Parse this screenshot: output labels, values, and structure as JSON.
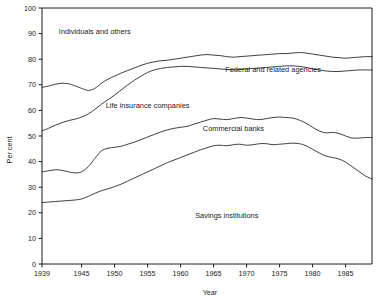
{
  "chart_data": {
    "type": "area",
    "title": "",
    "subtitle": "",
    "xlabel": "Year",
    "ylabel": "Per cent",
    "xlim": [
      1939,
      1989
    ],
    "ylim": [
      0,
      100
    ],
    "grid": false,
    "legend_position": "inline-annotations",
    "x_ticks": [
      1939,
      1945,
      1950,
      1955,
      1960,
      1965,
      1970,
      1975,
      1980,
      1985
    ],
    "y_ticks": [
      0,
      10,
      20,
      30,
      40,
      50,
      60,
      70,
      80,
      90,
      100
    ],
    "x": [
      1939,
      1940,
      1941,
      1942,
      1943,
      1944,
      1945,
      1946,
      1947,
      1948,
      1949,
      1950,
      1951,
      1952,
      1953,
      1954,
      1955,
      1956,
      1957,
      1958,
      1959,
      1960,
      1961,
      1962,
      1963,
      1964,
      1965,
      1966,
      1967,
      1968,
      1969,
      1970,
      1971,
      1972,
      1973,
      1974,
      1975,
      1976,
      1977,
      1978,
      1979,
      1980,
      1981,
      1982,
      1983,
      1984,
      1985,
      1986,
      1987,
      1988,
      1989
    ],
    "annotations": [
      {
        "text": "Individuals and others",
        "x": 1947,
        "y": 90
      },
      {
        "text": "Federal and related agencies",
        "x": 1974,
        "y": 75
      },
      {
        "text": "Life insurance companies",
        "x": 1955,
        "y": 61
      },
      {
        "text": "Commercial banks",
        "x": 1968,
        "y": 52
      },
      {
        "text": "Savings institutions",
        "x": 1967,
        "y": 18
      }
    ],
    "series": [
      {
        "name": "Individuals and others",
        "label": "Individuals and others",
        "description": "Upper cumulative boundary line",
        "values": [
          69,
          69.5,
          70.2,
          70.6,
          70.4,
          69.6,
          68.6,
          67.8,
          68.6,
          70.6,
          72.2,
          73.4,
          74.6,
          75.6,
          76.6,
          77.6,
          78.4,
          79.0,
          79.4,
          79.6,
          80.0,
          80.4,
          80.8,
          81.2,
          81.6,
          81.8,
          81.6,
          81.4,
          81.0,
          80.8,
          81.0,
          81.2,
          81.4,
          81.6,
          81.8,
          82.0,
          82.2,
          82.2,
          82.4,
          82.6,
          82.4,
          82.0,
          81.6,
          81.2,
          80.8,
          80.6,
          80.4,
          80.6,
          80.8,
          81.0,
          81.0
        ]
      },
      {
        "name": "Federal and related agencies",
        "label": "Federal and related agencies",
        "description": "Second cumulative boundary line",
        "values": [
          52,
          53.0,
          54.2,
          55.2,
          56.0,
          56.6,
          57.4,
          58.6,
          60.4,
          62.4,
          64.2,
          66.0,
          68.0,
          70.0,
          71.8,
          73.4,
          74.8,
          75.8,
          76.4,
          76.8,
          77.0,
          77.2,
          77.2,
          77.0,
          76.8,
          76.6,
          76.4,
          76.2,
          76.0,
          75.8,
          76.0,
          76.2,
          76.4,
          76.6,
          76.8,
          77.0,
          77.2,
          77.4,
          77.4,
          77.2,
          76.8,
          76.2,
          75.8,
          75.4,
          75.2,
          75.2,
          75.4,
          75.6,
          75.8,
          75.8,
          75.8
        ]
      },
      {
        "name": "Commercial banks",
        "label": "Commercial banks",
        "description": "Third cumulative boundary line",
        "values": [
          36,
          36.4,
          36.8,
          36.6,
          36.0,
          35.6,
          36.0,
          38.0,
          41.2,
          44.2,
          45.2,
          45.6,
          46.0,
          46.8,
          47.6,
          48.6,
          49.6,
          50.6,
          51.6,
          52.4,
          53.0,
          53.4,
          53.8,
          54.6,
          55.4,
          56.2,
          56.8,
          56.6,
          56.4,
          56.8,
          57.2,
          57.0,
          56.6,
          56.4,
          56.8,
          57.2,
          57.4,
          57.2,
          57.0,
          56.2,
          55.0,
          53.4,
          52.0,
          51.2,
          51.4,
          51.0,
          50.0,
          49.2,
          49.2,
          49.4,
          49.4
        ]
      },
      {
        "name": "Savings institutions",
        "label": "Savings institutions",
        "description": "Lowest cumulative boundary line",
        "values": [
          24,
          24.2,
          24.4,
          24.6,
          24.8,
          25.0,
          25.4,
          26.4,
          27.6,
          28.6,
          29.4,
          30.2,
          31.2,
          32.4,
          33.6,
          34.8,
          36.0,
          37.2,
          38.4,
          39.6,
          40.6,
          41.6,
          42.6,
          43.6,
          44.6,
          45.4,
          46.2,
          46.4,
          46.2,
          46.6,
          46.8,
          46.4,
          46.6,
          47.0,
          47.0,
          46.6,
          46.8,
          47.0,
          47.2,
          47.0,
          46.2,
          44.8,
          43.4,
          42.2,
          41.6,
          41.0,
          39.8,
          38.0,
          36.2,
          34.4,
          33.2
        ]
      }
    ]
  },
  "axes": {
    "y_title": "Per cent",
    "x_title": "Year"
  }
}
